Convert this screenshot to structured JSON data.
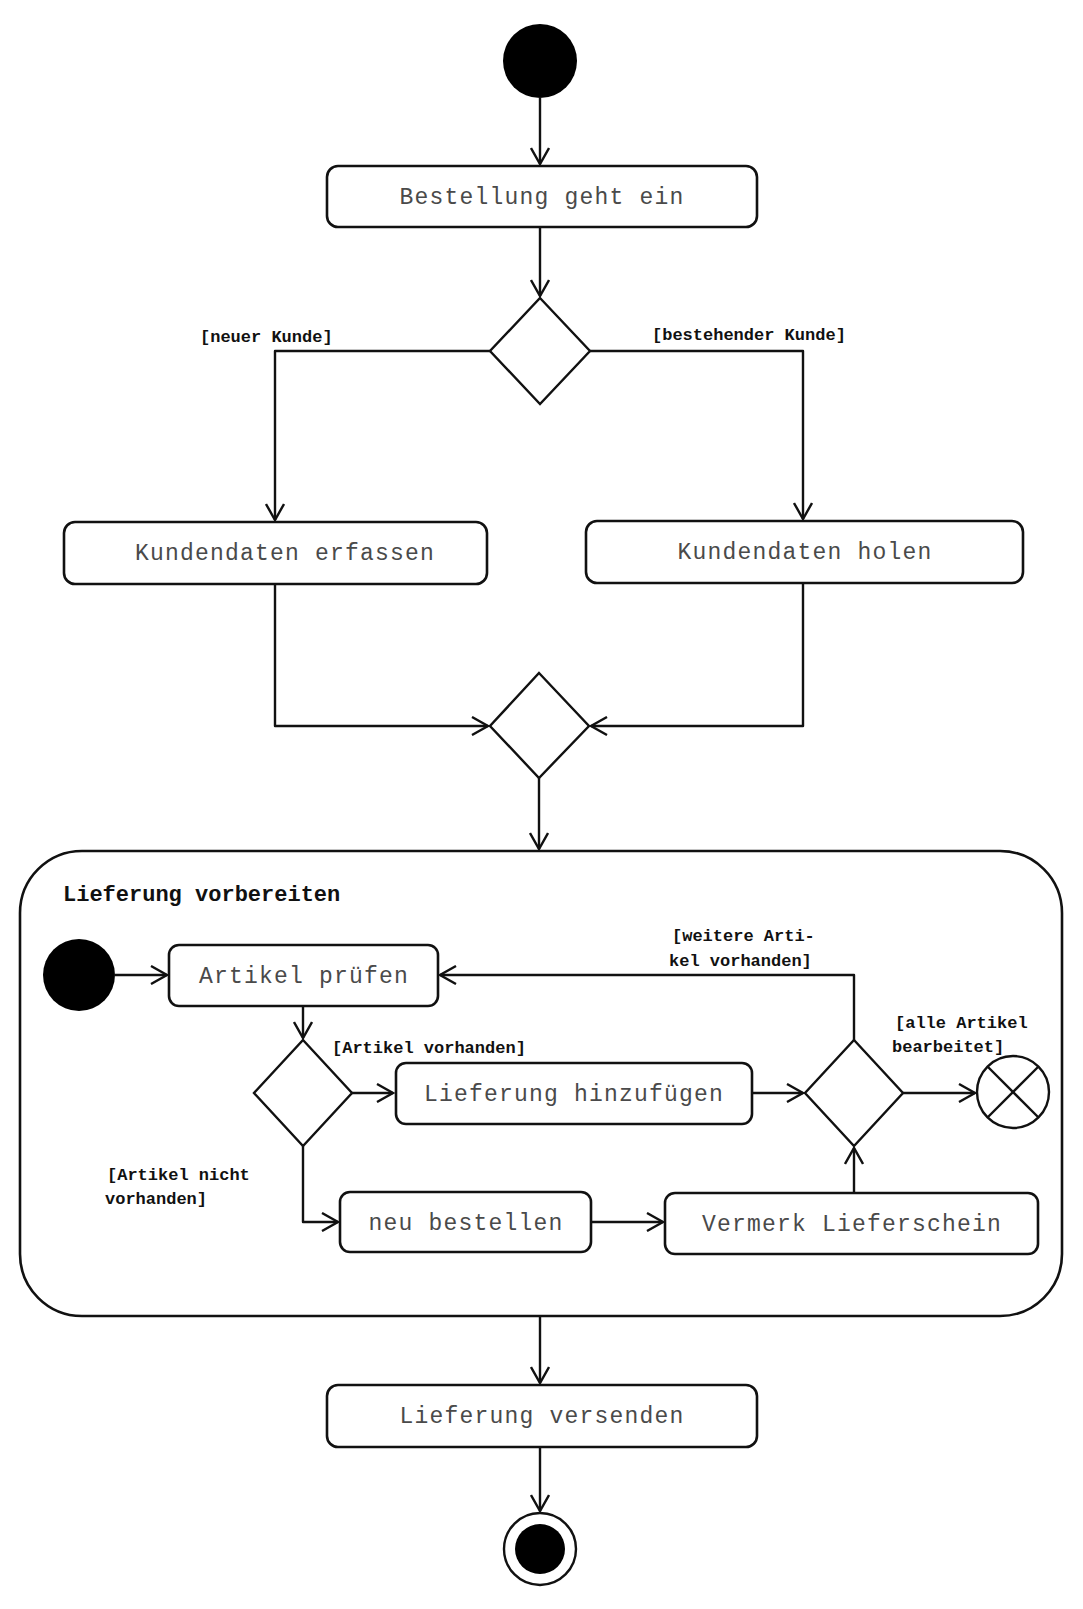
{
  "diagram": {
    "type": "UML activity diagram",
    "colors": {
      "line": "#111111",
      "fill": "#ffffff",
      "node_fill": "#000000",
      "label_text": "#4a4a4a"
    },
    "nodes": {
      "start": {
        "kind": "initial"
      },
      "order_received": {
        "kind": "action",
        "label": "Bestellung geht ein"
      },
      "customer_decision": {
        "kind": "decision"
      },
      "capture_customer": {
        "kind": "action",
        "label": "Kundendaten erfassen"
      },
      "fetch_customer": {
        "kind": "action",
        "label": "Kundendaten holen"
      },
      "customer_merge": {
        "kind": "merge"
      },
      "prepare_delivery": {
        "kind": "activity",
        "label": "Lieferung vorbereiten",
        "nodes": {
          "inner_start": {
            "kind": "initial"
          },
          "check_article": {
            "kind": "action",
            "label": "Artikel prüfen"
          },
          "article_decision": {
            "kind": "decision"
          },
          "add_to_delivery": {
            "kind": "action",
            "label": "Lieferung hinzufügen"
          },
          "reorder": {
            "kind": "action",
            "label": "neu bestellen"
          },
          "note_delivery_slip": {
            "kind": "action",
            "label": "Vermerk Lieferschein"
          },
          "loop_decision": {
            "kind": "decision"
          },
          "flow_final": {
            "kind": "flow-final"
          }
        }
      },
      "ship_delivery": {
        "kind": "action",
        "label": "Lieferung versenden"
      },
      "end": {
        "kind": "activity-final"
      }
    },
    "guards": {
      "new_customer": "[neuer Kunde]",
      "existing_customer": "[bestehender Kunde]",
      "article_available": "[Artikel vorhanden]",
      "article_not_available_1": "[Artikel nicht",
      "article_not_available_2": "vorhanden]",
      "more_articles_1": "[weitere Arti-",
      "more_articles_2": "kel vorhanden]",
      "all_processed_1": "[alle Artikel",
      "all_processed_2": "bearbeitet]"
    },
    "edges": [
      [
        "start",
        "order_received"
      ],
      [
        "order_received",
        "customer_decision"
      ],
      [
        "customer_decision",
        "capture_customer",
        "[neuer Kunde]"
      ],
      [
        "customer_decision",
        "fetch_customer",
        "[bestehender Kunde]"
      ],
      [
        "capture_customer",
        "customer_merge"
      ],
      [
        "fetch_customer",
        "customer_merge"
      ],
      [
        "customer_merge",
        "prepare_delivery"
      ],
      [
        "inner_start",
        "check_article"
      ],
      [
        "check_article",
        "article_decision"
      ],
      [
        "article_decision",
        "add_to_delivery",
        "[Artikel vorhanden]"
      ],
      [
        "article_decision",
        "reorder",
        "[Artikel nicht vorhanden]"
      ],
      [
        "reorder",
        "note_delivery_slip"
      ],
      [
        "add_to_delivery",
        "loop_decision"
      ],
      [
        "note_delivery_slip",
        "loop_decision"
      ],
      [
        "loop_decision",
        "check_article",
        "[weitere Artikel vorhanden]"
      ],
      [
        "loop_decision",
        "flow_final",
        "[alle Artikel bearbeitet]"
      ],
      [
        "prepare_delivery",
        "ship_delivery"
      ],
      [
        "ship_delivery",
        "end"
      ]
    ]
  }
}
